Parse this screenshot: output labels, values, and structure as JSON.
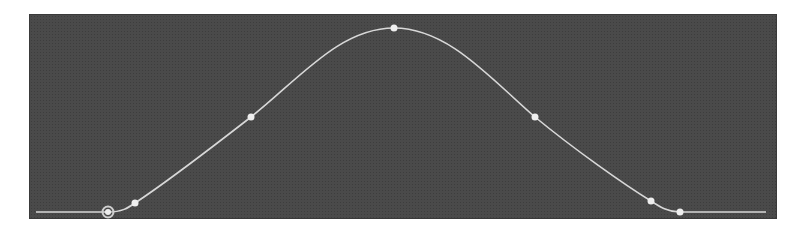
{
  "editor": {
    "type": "animation-curve-editor",
    "background_color": "#4a4a4a",
    "curve_color": "#d8d8d8",
    "point_color": "#eeeeee"
  },
  "curve": {
    "baseline_start": [
      36,
      212
    ],
    "baseline_end": [
      766,
      212
    ],
    "keyframes": [
      {
        "name": "start-keyframe",
        "x": 108,
        "y": 212,
        "selected": true
      },
      {
        "name": "in-handle",
        "x": 135,
        "y": 203,
        "selected": false
      },
      {
        "name": "rise-midpoint",
        "x": 251,
        "y": 117,
        "selected": false
      },
      {
        "name": "peak-keyframe",
        "x": 394,
        "y": 28,
        "selected": false
      },
      {
        "name": "fall-midpoint",
        "x": 535,
        "y": 117,
        "selected": false
      },
      {
        "name": "out-handle",
        "x": 651,
        "y": 201,
        "selected": false
      },
      {
        "name": "end-keyframe",
        "x": 680,
        "y": 212,
        "selected": false
      }
    ]
  }
}
